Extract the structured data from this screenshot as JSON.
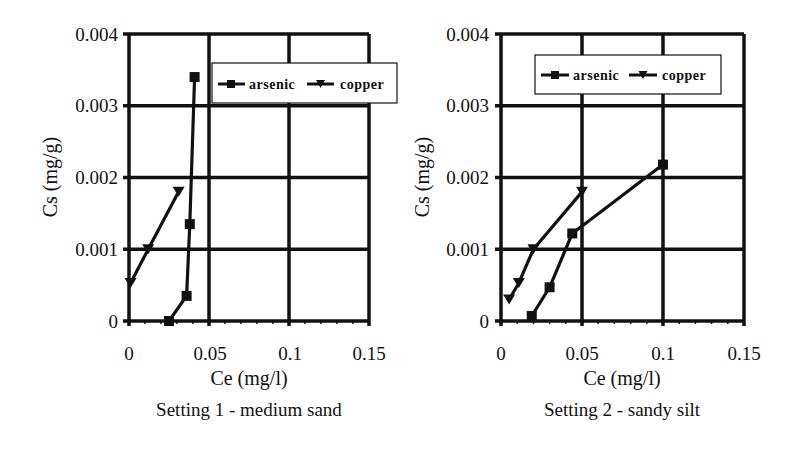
{
  "chart_data": [
    {
      "type": "line",
      "title": "Setting 1 - medium sand",
      "xlabel": "Ce (mg/l)",
      "ylabel": "Cs (mg/g)",
      "xlim": [
        0,
        0.15
      ],
      "ylim": [
        0,
        0.004
      ],
      "x_ticks": [
        "0",
        "0.05",
        "0.1",
        "0.15"
      ],
      "y_ticks": [
        "0",
        "0.001",
        "0.002",
        "0.003",
        "0.004"
      ],
      "grid": true,
      "legend_position": "upper right (inside)",
      "series": [
        {
          "name": "arsenic",
          "marker": "square",
          "points": [
            [
              0.025,
              0.0
            ],
            [
              0.036,
              0.00035
            ],
            [
              0.038,
              0.00135
            ],
            [
              0.041,
              0.0034
            ]
          ]
        },
        {
          "name": "copper",
          "marker": "triangle-down",
          "points": [
            [
              0.001,
              0.00053
            ],
            [
              0.012,
              0.001
            ],
            [
              0.031,
              0.0018
            ]
          ]
        }
      ]
    },
    {
      "type": "line",
      "title": "Setting 2 - sandy silt",
      "xlabel": "Ce (mg/l)",
      "ylabel": "Cs (mg/g)",
      "xlim": [
        0,
        0.15
      ],
      "ylim": [
        0,
        0.004
      ],
      "x_ticks": [
        "0",
        "0.05",
        "0.1",
        "0.15"
      ],
      "y_ticks": [
        "0",
        "0.001",
        "0.002",
        "0.003",
        "0.004"
      ],
      "grid": true,
      "legend_position": "upper center (inside)",
      "series": [
        {
          "name": "arsenic",
          "marker": "square",
          "points": [
            [
              0.019,
              7e-05
            ],
            [
              0.03,
              0.00047
            ],
            [
              0.044,
              0.00122
            ],
            [
              0.1,
              0.00218
            ]
          ]
        },
        {
          "name": "copper",
          "marker": "triangle-down",
          "points": [
            [
              0.005,
              0.0003
            ],
            [
              0.011,
              0.00053
            ],
            [
              0.02,
              0.001
            ],
            [
              0.05,
              0.0018
            ]
          ]
        }
      ]
    }
  ],
  "panels": [
    {
      "caption": "Setting 1 - medium sand",
      "xlabel": "Ce (mg/l)",
      "ylabel": "Cs (mg/g)",
      "x_ticks": [
        "0",
        "0.05",
        "0.1",
        "0.15"
      ],
      "y_ticks": [
        "0",
        "0.001",
        "0.002",
        "0.003",
        "0.004"
      ],
      "legend": {
        "arsenic": "arsenic",
        "copper": "copper"
      }
    },
    {
      "caption": "Setting 2 - sandy silt",
      "xlabel": "Ce (mg/l)",
      "ylabel": "Cs (mg/g)",
      "x_ticks": [
        "0",
        "0.05",
        "0.1",
        "0.15"
      ],
      "y_ticks": [
        "0",
        "0.001",
        "0.002",
        "0.003",
        "0.004"
      ],
      "legend": {
        "arsenic": "arsenic",
        "copper": "copper"
      }
    }
  ],
  "colors": {
    "line": "#111111",
    "grid": "#111111",
    "background": "#ffffff"
  }
}
